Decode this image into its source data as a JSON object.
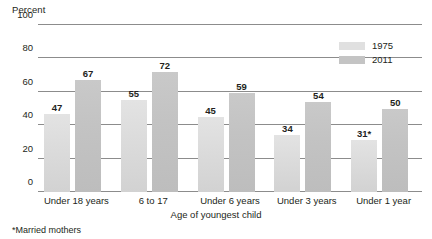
{
  "chart_data": {
    "type": "bar",
    "title": "",
    "subtitle": "",
    "ylabel": "Percent",
    "xlabel": "Age of youngest child",
    "ylim": [
      0,
      100
    ],
    "yticks": [
      0,
      20,
      40,
      60,
      80,
      100
    ],
    "grid": true,
    "legend_position": "top-right",
    "categories": [
      "Under 18 years",
      "6 to 17",
      "Under 6 years",
      "Under 3 years",
      "Under 1 year"
    ],
    "series": [
      {
        "name": "1975",
        "color": "#e0e0e0",
        "values": [
          47,
          55,
          45,
          34,
          31
        ],
        "labels": [
          "47",
          "55",
          "45",
          "34",
          "31*"
        ]
      },
      {
        "name": "2011",
        "color": "#c4c4c4",
        "values": [
          67,
          72,
          59,
          54,
          50
        ],
        "labels": [
          "67",
          "72",
          "59",
          "54",
          "50"
        ]
      }
    ],
    "footnote": "*Married mothers"
  },
  "axis": {
    "percent_caption": "Percent",
    "x_title": "Age of youngest child",
    "tick_labels": [
      "100",
      "80",
      "60",
      "40",
      "20",
      "0"
    ]
  },
  "legend": {
    "items": [
      {
        "label": "1975"
      },
      {
        "label": "2011"
      }
    ]
  },
  "footnote": {
    "text": "*Married mothers"
  }
}
